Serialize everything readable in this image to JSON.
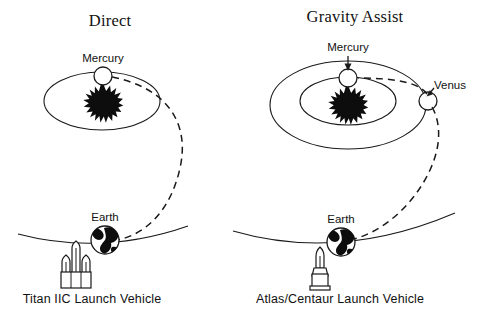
{
  "figure": {
    "type": "orbital-trajectory-diagram",
    "background_color": "#ffffff",
    "ink_color": "#1a1a1a",
    "width": 485,
    "height": 317
  },
  "panels": [
    {
      "id": "direct",
      "title": "Direct",
      "caption": "Titan IIC Launch Vehicle",
      "launch_vehicle": {
        "name": "Titan IIC",
        "stage_count": 3,
        "style": "three-booster-cluster"
      },
      "bodies": [
        {
          "name": "Sun",
          "label": "",
          "render": "starburst",
          "labelled": false
        },
        {
          "name": "Mercury",
          "label": "Mercury",
          "render": "open-circle",
          "labelled": true,
          "has_arrow": false
        },
        {
          "name": "Earth",
          "label": "Earth",
          "render": "globe",
          "labelled": true,
          "has_arrow": false
        }
      ],
      "orbits": [
        {
          "name": "mercury-orbit",
          "shape": "ellipse"
        },
        {
          "name": "earth-orbit",
          "shape": "arc"
        }
      ],
      "trajectory": {
        "name": "direct-transfer-trajectory",
        "style": "dashed",
        "from": "Earth",
        "to": "Mercury",
        "flybys": []
      }
    },
    {
      "id": "gravity-assist",
      "title": "Gravity Assist",
      "caption": "Atlas/Centaur Launch Vehicle",
      "launch_vehicle": {
        "name": "Atlas/Centaur",
        "stage_count": 1,
        "style": "single-stack"
      },
      "bodies": [
        {
          "name": "Sun",
          "label": "",
          "render": "starburst",
          "labelled": false
        },
        {
          "name": "Mercury",
          "label": "Mercury",
          "render": "open-circle",
          "labelled": true,
          "has_arrow": true
        },
        {
          "name": "Venus",
          "label": "Venus",
          "render": "open-circle",
          "labelled": true,
          "has_arrow": false
        },
        {
          "name": "Earth",
          "label": "Earth",
          "render": "globe",
          "labelled": true,
          "has_arrow": false
        }
      ],
      "orbits": [
        {
          "name": "mercury-orbit",
          "shape": "ellipse"
        },
        {
          "name": "venus-orbit",
          "shape": "ellipse"
        },
        {
          "name": "earth-orbit",
          "shape": "arc"
        }
      ],
      "trajectory": {
        "name": "venus-gravity-assist-trajectory",
        "style": "dashed",
        "from": "Earth",
        "to": "Mercury",
        "flybys": [
          "Venus"
        ]
      }
    }
  ]
}
